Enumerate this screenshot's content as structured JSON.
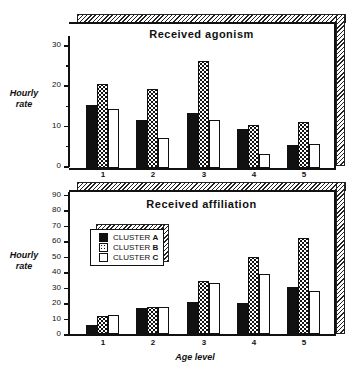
{
  "chart_data": [
    {
      "type": "bar",
      "title": "Received agonism",
      "xlabel": "",
      "ylabel": "Hourly rate",
      "ylim": [
        0,
        35
      ],
      "yticks": [
        0,
        10,
        20,
        30
      ],
      "categories": [
        "1",
        "2",
        "3",
        "4",
        "5"
      ],
      "series": [
        {
          "name": "CLUSTER A",
          "values": [
            15.6,
            12.0,
            13.6,
            9.8,
            5.6
          ]
        },
        {
          "name": "CLUSTER B",
          "values": [
            20.8,
            19.5,
            26.6,
            10.6,
            11.4
          ]
        },
        {
          "name": "CLUSTER C",
          "values": [
            14.6,
            7.4,
            12.0,
            3.6,
            6.0
          ]
        }
      ],
      "grid": false
    },
    {
      "type": "bar",
      "title": "Received affiliation",
      "xlabel": "Age level",
      "ylabel": "Hourly rate",
      "ylim": [
        0,
        92
      ],
      "yticks": [
        0,
        10,
        20,
        30,
        40,
        50,
        60,
        70,
        80,
        90
      ],
      "categories": [
        "1",
        "2",
        "3",
        "4",
        "5"
      ],
      "series": [
        {
          "name": "CLUSTER A",
          "values": [
            5.8,
            16.6,
            20.5,
            19.9,
            30.6
          ]
        },
        {
          "name": "CLUSTER B",
          "values": [
            11.7,
            17.7,
            34.5,
            50.1,
            62.2
          ]
        },
        {
          "name": "CLUSTER C",
          "values": [
            12.1,
            17.3,
            33.2,
            39.1,
            27.6
          ]
        }
      ],
      "legend": {
        "position": "upper-left",
        "entries": [
          {
            "label": "CLUSTER",
            "key": "A",
            "fill": "solid-black"
          },
          {
            "label": "CLUSTER",
            "key": "B",
            "fill": "dotted"
          },
          {
            "label": "CLUSTER",
            "key": "C",
            "fill": "white"
          }
        ]
      },
      "grid": false
    }
  ],
  "top": {
    "title": "Received agonism",
    "ylabel_line1": "Hourly",
    "ylabel_line2": "rate"
  },
  "bottom": {
    "title": "Received affiliation",
    "ylabel_line1": "Hourly",
    "ylabel_line2": "rate",
    "xlabel": "Age level"
  }
}
